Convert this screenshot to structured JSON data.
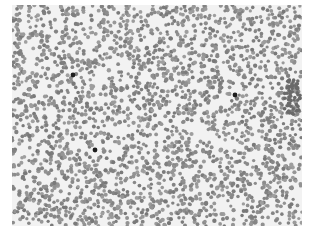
{
  "image": {
    "description": "Grayscale microscopy field of densely packed round cells (blood smear) with a few dark-stained cells",
    "background_color": "#f2f2f2",
    "cell_color": "#8a8a8a",
    "dark_cell_color": "#1e1e1e",
    "dark_cells": [
      {
        "x": 61,
        "y": 70
      },
      {
        "x": 223,
        "y": 90
      },
      {
        "x": 83,
        "y": 145
      }
    ]
  }
}
